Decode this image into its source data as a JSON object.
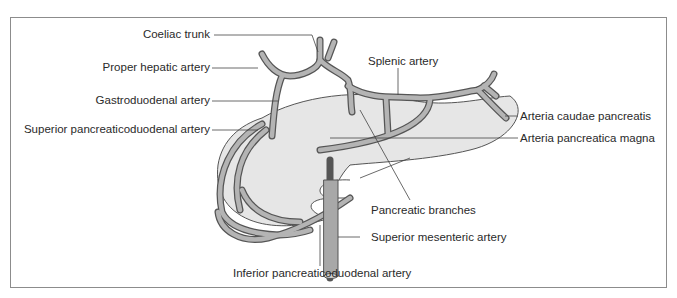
{
  "figure": {
    "frame_color": "#8c8c8c",
    "pancreas_fill": "#e6e6e6",
    "artery_fill": "#b4b4b4",
    "artery_outline": "#555555",
    "leader_color": "#444444"
  },
  "labels": {
    "coeliac_trunk": "Coeliac trunk",
    "proper_hepatic_artery": "Proper hepatic artery",
    "gastroduodenal_artery": "Gastroduodenal artery",
    "superior_pancreaticoduodenal_artery": "Superior pancreaticoduodenal artery",
    "splenic_artery": "Splenic artery",
    "arteria_caudae_pancreatis": "Arteria caudae pancreatis",
    "arteria_pancreatica_magna": "Arteria pancreatica magna",
    "pancreatic_branches": "Pancreatic branches",
    "superior_mesenteric_artery": "Superior mesenteric artery",
    "inferior_pancreaticoduodenal_artery": "Inferior pancreaticoduodenal artery"
  }
}
